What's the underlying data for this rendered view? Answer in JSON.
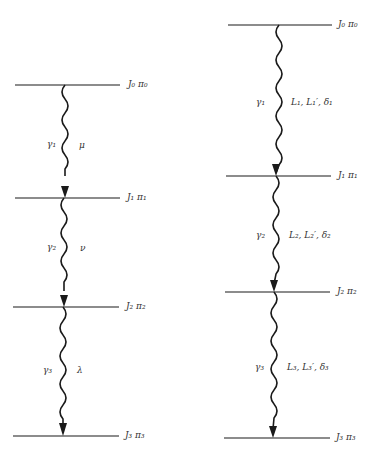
{
  "diagrams": [
    {
      "name": "left-cascade",
      "levels": [
        {
          "label": "J₀  π₀",
          "y": 85
        },
        {
          "label": "J₁ π₁",
          "y": 198
        },
        {
          "label": "J₂  π₂",
          "y": 307
        },
        {
          "label": "J₃ π₃",
          "y": 436
        }
      ],
      "transitions": [
        {
          "gamma": "γ₁",
          "param": "μ"
        },
        {
          "gamma": "γ₂",
          "param": "ν"
        },
        {
          "gamma": "γ₃",
          "param": "λ"
        }
      ]
    },
    {
      "name": "right-cascade",
      "levels": [
        {
          "label": "J₀ π₀",
          "y": 25
        },
        {
          "label": "J₁ π₁",
          "y": 176
        },
        {
          "label": "J₂ π₂",
          "y": 292
        },
        {
          "label": "J₃ π₃",
          "y": 438
        }
      ],
      "transitions": [
        {
          "gamma": "γ₁",
          "param": "L₁, L₁′, δ₁"
        },
        {
          "gamma": "γ₂",
          "param": "L₂, L₂′, δ₂"
        },
        {
          "gamma": "γ₃",
          "param": "L₃, L₃′, δ₃"
        }
      ]
    }
  ]
}
